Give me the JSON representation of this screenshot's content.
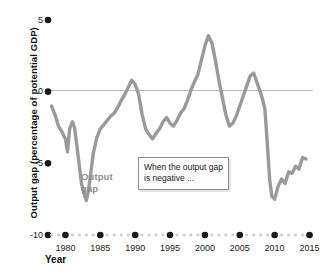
{
  "chart_data": {
    "type": "line",
    "title": "",
    "xlabel": "Year",
    "ylabel": "Output gap (percentage of potential GDP)",
    "xlim": [
      1977.5,
      2015.5
    ],
    "ylim": [
      -10,
      5
    ],
    "grid": false,
    "zero_line": true,
    "legend_position": "inline-annotation",
    "series": [
      {
        "name": "Output gap",
        "color": "#9a9a9a",
        "x": [
          1978.0,
          1978.5,
          1979.0,
          1979.5,
          1980.0,
          1980.3,
          1980.6,
          1981.0,
          1981.3,
          1981.6,
          1982.0,
          1982.3,
          1982.6,
          1983.0,
          1983.3,
          1983.6,
          1984.0,
          1984.5,
          1985.0,
          1985.5,
          1986.0,
          1986.5,
          1987.0,
          1987.5,
          1988.0,
          1988.5,
          1989.0,
          1989.5,
          1990.0,
          1990.5,
          1991.0,
          1991.5,
          1992.0,
          1992.5,
          1993.0,
          1993.5,
          1994.0,
          1994.5,
          1995.0,
          1995.5,
          1996.0,
          1996.5,
          1997.0,
          1997.5,
          1998.0,
          1998.5,
          1999.0,
          1999.5,
          2000.0,
          2000.5,
          2001.0,
          2001.5,
          2002.0,
          2002.5,
          2003.0,
          2003.5,
          2004.0,
          2004.5,
          2005.0,
          2005.5,
          2006.0,
          2006.5,
          2007.0,
          2007.5,
          2008.0,
          2008.3,
          2008.6,
          2009.0,
          2009.3,
          2009.6,
          2010.0,
          2010.5,
          2011.0,
          2011.5,
          2012.0,
          2012.5,
          2013.0,
          2013.5,
          2014.0,
          2014.5
        ],
        "y": [
          -1.0,
          -1.6,
          -2.4,
          -2.8,
          -3.3,
          -4.2,
          -2.6,
          -2.1,
          -2.5,
          -3.6,
          -5.2,
          -6.4,
          -7.0,
          -7.6,
          -6.9,
          -5.8,
          -4.3,
          -3.2,
          -2.6,
          -2.3,
          -2.0,
          -1.7,
          -1.5,
          -1.1,
          -0.6,
          -0.2,
          0.3,
          0.8,
          0.5,
          -0.2,
          -1.6,
          -2.6,
          -3.0,
          -3.3,
          -2.9,
          -2.6,
          -2.1,
          -1.8,
          -2.2,
          -2.4,
          -2.0,
          -1.5,
          -1.2,
          -0.6,
          0.1,
          0.7,
          1.2,
          2.2,
          3.2,
          3.9,
          3.4,
          2.2,
          0.8,
          -0.4,
          -1.6,
          -2.4,
          -2.2,
          -1.7,
          -1.0,
          -0.3,
          0.4,
          1.1,
          1.3,
          0.6,
          -0.1,
          -0.6,
          -1.2,
          -4.0,
          -6.2,
          -7.3,
          -7.5,
          -6.6,
          -6.1,
          -6.4,
          -5.6,
          -5.7,
          -5.2,
          -5.4,
          -4.6,
          -4.7
        ]
      }
    ],
    "y_ticks": [
      5,
      0,
      -5,
      -10
    ],
    "y_tick_labels": [
      "5",
      "0",
      "-5",
      "-10"
    ],
    "x_ticks": [
      1980,
      1985,
      1990,
      1995,
      2000,
      2005,
      2010,
      2015
    ],
    "x_tick_labels": [
      "1980",
      "1985",
      "1990",
      "1995",
      "2000",
      "2005",
      "2010",
      "2015"
    ],
    "x_minor_ticks": [
      1978,
      1979,
      1981,
      1982,
      1983,
      1984,
      1986,
      1987,
      1988,
      1989,
      1991,
      1992,
      1993,
      1994,
      1996,
      1997,
      1998,
      1999,
      2001,
      2002,
      2003,
      2004,
      2006,
      2007,
      2008,
      2009,
      2011,
      2012,
      2013,
      2014
    ],
    "annotations": [
      {
        "id": "series-label",
        "text_line1": "Output",
        "text_line2": "gap",
        "color": "#8f8f8f"
      },
      {
        "id": "callout",
        "text": "When the output gap is negative ..."
      }
    ],
    "colors": {
      "line": "#9a9a9a",
      "zero_line": "#b9b9b9",
      "major_tick_dot": "#1a1a1a",
      "minor_tick_dot": "#cccccc",
      "text": "#1a1a1a",
      "callout_border": "#8c8c8c"
    }
  }
}
